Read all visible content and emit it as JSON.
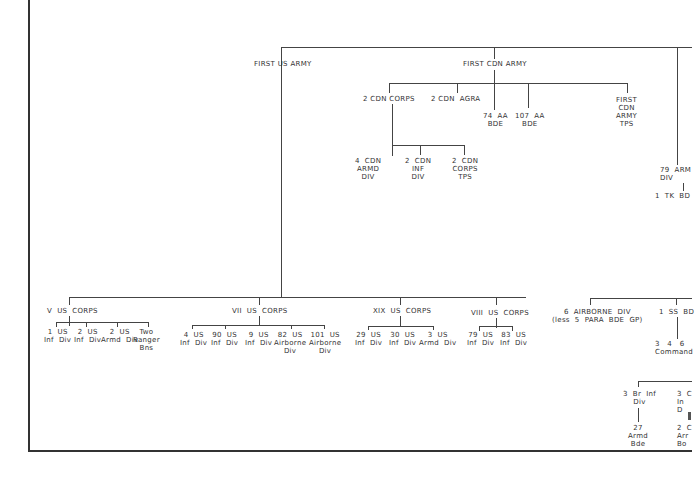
{
  "top_level": {
    "first_us_army": "FIRST US ARMY",
    "first_cdn_army": "FIRST CDN ARMY"
  },
  "cdn": {
    "corps2": "2 CDN CORPS",
    "agra": "2 CDN  AGRA",
    "aa74": "74  AA\nBDE",
    "aa107": "107  AA\nBDE",
    "army_tps": "FIRST\nCDN\nARMY\nTPS",
    "armd4": "4  CDN\nARMD\nDIV",
    "inf2": "2  CDN\nINF\nDIV",
    "corps_tps": "2  CDN\nCORPS\nTPS"
  },
  "british": {
    "armd79": "79  ARM\nDIV",
    "tk1": "1  TK  BD",
    "airborne6": "6  AIRBORNE  DIV\n(less  5  PARA  BDE  GP)",
    "ss1": "1  SS  BD",
    "commando": "3   4   6\nCommand",
    "br_inf3": "3  Br  Inf\nDiv",
    "armd27": "27\nArmd\nBde",
    "c_inf3": "3  C\nIn\nD",
    "c_armd2": "2  C\nArr\nBo"
  },
  "us": {
    "v_corps": {
      "label": "V  US  CORPS",
      "units": [
        "1  US\nInf  Div",
        "2  US\nInf  Div",
        "2  US\nArmd  Div",
        "Two\nRanger\nBns"
      ]
    },
    "vii_corps": {
      "label": "VII  US  CORPS",
      "units": [
        "4  US\nInf  Div",
        "90  US\nInf  Div",
        "9  US\nInf  Div",
        "82  US\nAirborne\nDiv",
        "101  US\nAirborne\nDiv"
      ]
    },
    "xix_corps": {
      "label": "XIX  US  CORPS",
      "units": [
        "29  US\nInf  Div",
        "30  US\nInf  Div",
        "3  US\nArmd  Div"
      ]
    },
    "viii_corps": {
      "label": "VIII  US  CORPS",
      "units": [
        "79  US\nInf  Div",
        "83  US\nInf  Div"
      ]
    }
  }
}
